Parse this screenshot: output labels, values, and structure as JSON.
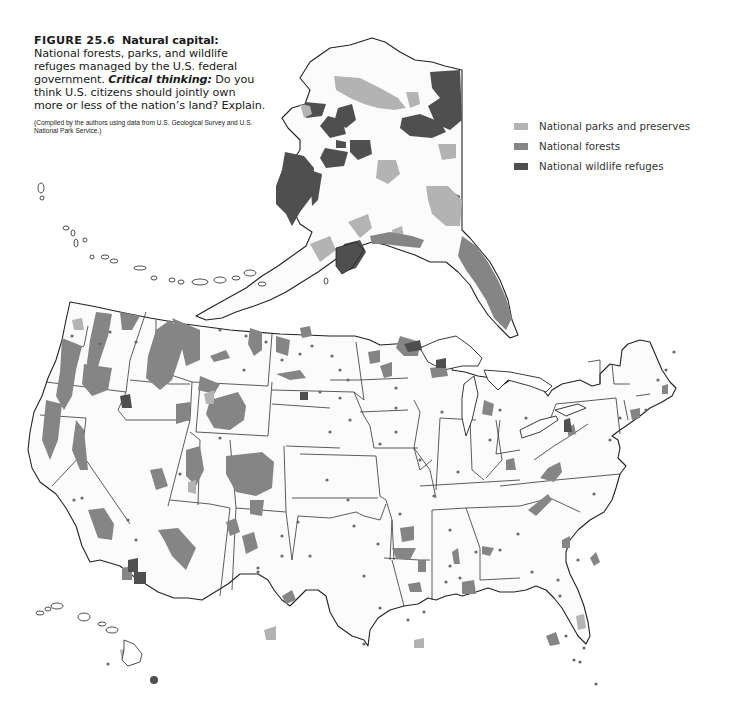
{
  "caption": {
    "figure_number": "FIGURE 25.6",
    "title": "Natural capital:",
    "description": "National forests, parks, and wildlife refuges managed by the U.S. federal government.",
    "critical_label": "Critical thinking:",
    "critical_text": "Do you think U.S. citizens should jointly own more or less of the nation’s land? Explain.",
    "source": "(Compiled by the authors using data from U.S. Geological Survey and U.S. National Park Service.)"
  },
  "legend": {
    "items": [
      {
        "label": "National parks and preserves",
        "color": "#b3b3b3"
      },
      {
        "label": "National forests",
        "color": "#858585"
      },
      {
        "label": "National wildlife refuges",
        "color": "#4f4f4f"
      }
    ]
  },
  "map": {
    "regions": [
      "Alaska",
      "Aleutian Islands",
      "Contiguous United States",
      "Hawaii"
    ],
    "colors": {
      "land": "#fbfbfb",
      "border": "#222222",
      "parks": "#b3b3b3",
      "forests": "#858585",
      "refuges": "#4f4f4f"
    }
  }
}
